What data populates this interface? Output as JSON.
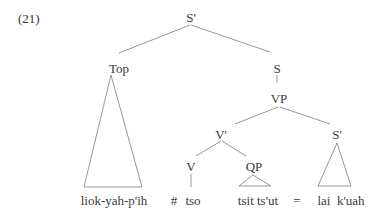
{
  "example_number": "(21)",
  "tree": {
    "root": {
      "label": "S'"
    },
    "topic": {
      "label": "Top",
      "leaf": "liok-yah-p'ih"
    },
    "s": {
      "label": "S"
    },
    "vp": {
      "label": "VP"
    },
    "vbar": {
      "label": "V'"
    },
    "v": {
      "label": "V",
      "leaf": "tso"
    },
    "qp": {
      "label": "QP",
      "leaf": "tsit ts'ut"
    },
    "sbar": {
      "label": "S'",
      "leaf": "lai  k'uah"
    }
  },
  "symbols": {
    "boundary": "#",
    "equals": "="
  },
  "colors": {
    "line": "#8a8a8a",
    "text": "#3a3a3a",
    "background": "#ffffff"
  }
}
